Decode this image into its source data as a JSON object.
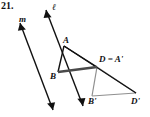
{
  "figure": {
    "problem_number": "21.",
    "colors": {
      "ink": "#111111",
      "preimage_stroke": "#111111",
      "image_stroke": "#8f8f8f",
      "segment_bd": "#4a4a4a",
      "background": "#ffffff"
    },
    "lines": [
      {
        "name": "line-ell",
        "label": "ℓ",
        "from": [
          46,
          10
        ],
        "to": [
          83,
          106
        ],
        "arrow_start": true,
        "arrow_end": true,
        "stroke": "#111111"
      },
      {
        "name": "line-m",
        "label": "m",
        "from": [
          20,
          23
        ],
        "to": [
          53,
          110
        ],
        "arrow_start": true,
        "arrow_end": true,
        "stroke": "#111111"
      }
    ],
    "points": [
      {
        "name": "point-A",
        "label": "A",
        "x": 64,
        "y": 46
      },
      {
        "name": "point-B",
        "label": "B",
        "x": 58,
        "y": 72
      },
      {
        "name": "point-D",
        "label": "D = A'",
        "x": 97,
        "y": 67
      },
      {
        "name": "point-Bp",
        "label": "B'",
        "x": 92,
        "y": 96
      },
      {
        "name": "point-Dp",
        "label": "D'",
        "x": 136,
        "y": 93
      }
    ],
    "segments": [
      {
        "name": "segment-A-B",
        "from": [
          64,
          46
        ],
        "to": [
          58,
          72
        ],
        "stroke": "#111111",
        "width": 1.3
      },
      {
        "name": "segment-B-D",
        "from": [
          58,
          72
        ],
        "to": [
          97,
          67
        ],
        "stroke": "#4a4a4a",
        "width": 2.6
      },
      {
        "name": "segment-A-D",
        "from": [
          64,
          46
        ],
        "to": [
          97,
          67
        ],
        "stroke": "#111111",
        "width": 1.3
      },
      {
        "name": "segment-A-Dp",
        "from": [
          64,
          46
        ],
        "to": [
          136,
          93
        ],
        "stroke": "#111111",
        "width": 1.3
      },
      {
        "name": "segment-D-Bp",
        "from": [
          97,
          67
        ],
        "to": [
          92,
          96
        ],
        "stroke": "#8f8f8f",
        "width": 1.2
      },
      {
        "name": "segment-Bp-Dp",
        "from": [
          92,
          96
        ],
        "to": [
          136,
          93
        ],
        "stroke": "#8f8f8f",
        "width": 1.2
      },
      {
        "name": "segment-D-Dp",
        "from": [
          97,
          67
        ],
        "to": [
          136,
          93
        ],
        "stroke": "#8f8f8f",
        "width": 1.2
      }
    ],
    "labels": {
      "line_ell": "ℓ",
      "line_m": "m",
      "vertex_A": "A",
      "vertex_B": "B",
      "vertex_D_equals_Aprime": "D = A'",
      "vertex_Bprime": "B'",
      "vertex_Dprime": "D'"
    }
  }
}
